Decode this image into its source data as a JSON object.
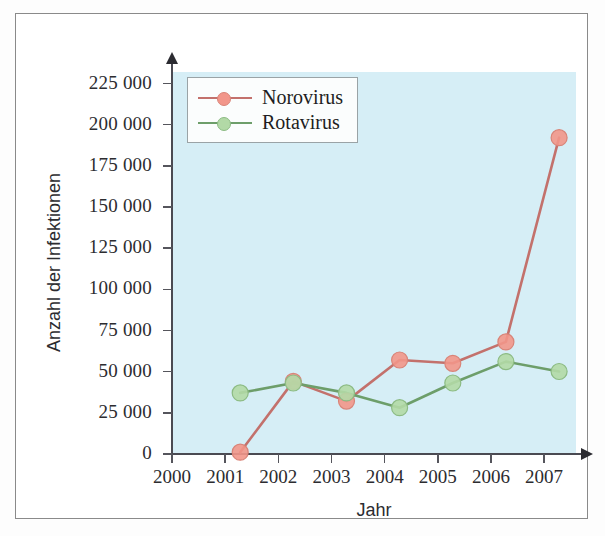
{
  "chart_data": {
    "type": "line",
    "title": "",
    "xlabel": "Jahr",
    "ylabel": "Anzahl der Infektionen",
    "x": [
      2001,
      2002,
      2003,
      2004,
      2005,
      2006,
      2007
    ],
    "categories": [
      "2001",
      "2002",
      "2003",
      "2004",
      "2005",
      "2006",
      "2007"
    ],
    "xtick_labels": [
      "2000",
      "2001",
      "2002",
      "2003",
      "2004",
      "2005",
      "2006",
      "2007"
    ],
    "xlim": [
      2000,
      2007.6
    ],
    "ylim": [
      0,
      232000
    ],
    "ytick_values": [
      0,
      25000,
      50000,
      75000,
      100000,
      125000,
      150000,
      175000,
      200000,
      225000
    ],
    "ytick_labels": [
      "0",
      "25 000",
      "50 000",
      "75 000",
      "100 000",
      "125 000",
      "150 000",
      "175 000",
      "200 000",
      "225 000"
    ],
    "grid": false,
    "legend_position": "upper left",
    "plot_background": "#d6eef6",
    "series": [
      {
        "name": "Norovirus",
        "values": [
          9000,
          52000,
          40000,
          65000,
          63000,
          76000,
          200000
        ],
        "line_color": "#c3716c",
        "marker_color": "#f2968a",
        "marker_edge": "#d98478"
      },
      {
        "name": "Rotavirus",
        "values": [
          45000,
          51000,
          45000,
          36000,
          51000,
          64000,
          58000
        ],
        "line_color": "#6d9e6a",
        "marker_color": "#b2d9a6",
        "marker_edge": "#8cbb83"
      }
    ]
  }
}
